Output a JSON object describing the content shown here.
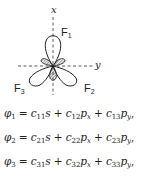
{
  "diagram": {
    "axis_x_label": "x",
    "axis_y_label": "y",
    "orbitals": [
      {
        "name": "F",
        "sub": "1"
      },
      {
        "name": "F",
        "sub": "2"
      },
      {
        "name": "F",
        "sub": "3"
      }
    ]
  },
  "equations": [
    {
      "lhs": "φ",
      "lhs_sub": "1",
      "t1c": "c",
      "t1s": "11",
      "t1v": "s",
      "t2c": "c",
      "t2s": "12",
      "t2v": "p",
      "t2vs": "x",
      "t3c": "c",
      "t3s": "13",
      "t3v": "p",
      "t3vs": "y"
    },
    {
      "lhs": "φ",
      "lhs_sub": "2",
      "t1c": "c",
      "t1s": "21",
      "t1v": "s",
      "t2c": "c",
      "t2s": "22",
      "t2v": "p",
      "t2vs": "x",
      "t3c": "c",
      "t3s": "23",
      "t3v": "p",
      "t3vs": "y"
    },
    {
      "lhs": "φ",
      "lhs_sub": "3",
      "t1c": "c",
      "t1s": "31",
      "t1v": "s",
      "t2c": "c",
      "t2s": "32",
      "t2v": "p",
      "t2vs": "x",
      "t3c": "c",
      "t3s": "33",
      "t3v": "p",
      "t3vs": "y"
    }
  ],
  "symbols": {
    "eq": " = ",
    "plus": " + ",
    "comma": ","
  }
}
